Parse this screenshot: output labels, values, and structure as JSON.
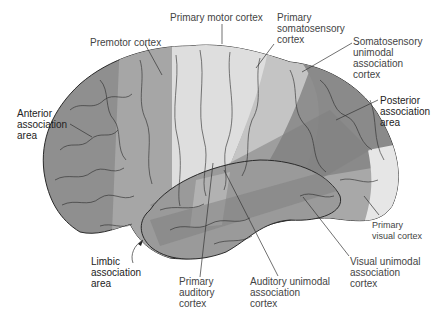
{
  "diagram": {
    "type": "anatomical-illustration",
    "colors": {
      "background": "#ffffff",
      "association_dark": "#8e8e8e",
      "premotor": "#a4a4a4",
      "primary_light": "#dcdcdc",
      "unimodal": "#a8a8a8",
      "temporal": "#9a9a9a",
      "outline": "#2a2a2a",
      "label_text": "#444444"
    }
  },
  "labels": {
    "primary_motor": "Primary motor cortex",
    "premotor": "Premotor cortex",
    "primary_somatosensory": "Primary\nsomatosensory\ncortex",
    "somatosensory_unimodal": "Somatosensory\nunimodal\nassociation\ncortex",
    "anterior_association": "Anterior\nassociation\narea",
    "posterior_association": "Posterior\nassociation\narea",
    "limbic_association": "Limbic\nassociation\narea",
    "primary_auditory": "Primary\nauditory\ncortex",
    "auditory_unimodal": "Auditory unimodal\nassociation\ncortex",
    "visual_unimodal": "Visual unimodal\nassociation\ncortex",
    "primary_visual": "Primary\nvisual cortex"
  }
}
